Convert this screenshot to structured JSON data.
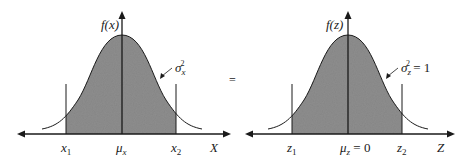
{
  "equals_sign": "=",
  "colors": {
    "fill": "#8e8e8e",
    "stroke": "#1a1a1a",
    "background": "#ffffff"
  },
  "left_panel": {
    "y_axis_label": "f(x)",
    "x_axis_label": "X",
    "ticks": [
      {
        "base": "x",
        "sub": "1"
      },
      {
        "base": "μ",
        "sub": "x"
      },
      {
        "base": "x",
        "sub": "2"
      }
    ],
    "variance_label": {
      "base": "σ",
      "sub": "x",
      "sup": "2",
      "suffix": ""
    }
  },
  "right_panel": {
    "y_axis_label": "f(z)",
    "x_axis_label": "Z",
    "ticks": [
      {
        "base": "z",
        "sub": "1"
      },
      {
        "base": "μ",
        "sub": "z",
        "suffix": " = 0"
      },
      {
        "base": "z",
        "sub": "2"
      }
    ],
    "variance_label": {
      "base": "σ",
      "sub": "z",
      "sup": "2",
      "suffix": " = 1"
    }
  }
}
